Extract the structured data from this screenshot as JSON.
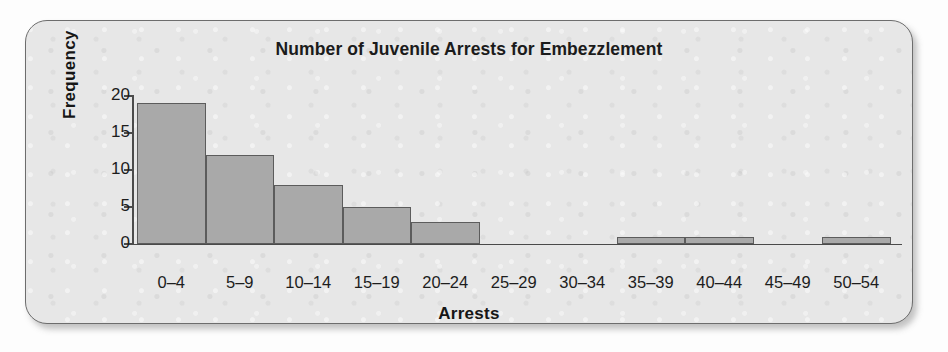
{
  "figure": {
    "panel_fill": "#e7e7e7",
    "panel_border": "#6d6d6d"
  },
  "chart_data": {
    "type": "bar",
    "title": "Number of Juvenile Arrests for Embezzlement",
    "xlabel": "Arrests",
    "ylabel": "Frequency",
    "categories": [
      "0–4",
      "5–9",
      "10–14",
      "15–19",
      "20–24",
      "25–29",
      "30–34",
      "35–39",
      "40–44",
      "45–49",
      "50–54"
    ],
    "values": [
      19,
      12,
      8,
      5,
      3,
      0,
      0,
      1,
      1,
      0,
      1
    ],
    "ytick_labels": [
      "0",
      "5",
      "10",
      "15",
      "20"
    ],
    "yticks": [
      0,
      5,
      10,
      15,
      20
    ],
    "ylim": [
      0,
      20
    ],
    "grid": false,
    "legend": false,
    "bar_fill": "#a9a9a9",
    "bar_edge": "#5c5c5c",
    "series": [
      {
        "name": "Frequency",
        "values": [
          19,
          12,
          8,
          5,
          3,
          0,
          0,
          1,
          1,
          0,
          1
        ]
      }
    ]
  }
}
